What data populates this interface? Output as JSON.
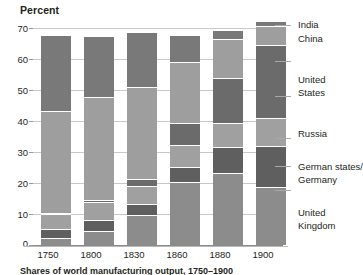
{
  "chart_data": {
    "type": "bar",
    "title": "Percent",
    "subtitle": "",
    "xlabel": "",
    "ylabel": "Percent",
    "ylim": [
      0,
      70
    ],
    "yticks": [
      0,
      10,
      20,
      30,
      40,
      50,
      60,
      70
    ],
    "grid": true,
    "stacked": true,
    "legend_position": "right",
    "categories": [
      "1750",
      "1800",
      "1830",
      "1860",
      "1880",
      "1900"
    ],
    "series": [
      {
        "name": "United Kingdom",
        "color": "#8c8c8c",
        "values": [
          1.9,
          4.3,
          9.5,
          19.9,
          22.9,
          18.5
        ]
      },
      {
        "name": "German states/ Germany",
        "color": "#5f5f5f",
        "values": [
          2.9,
          3.5,
          3.5,
          4.9,
          8.5,
          13.2
        ]
      },
      {
        "name": "Russia",
        "color": "#a0a0a0",
        "values": [
          5.0,
          5.6,
          5.6,
          7.0,
          7.6,
          8.8
        ]
      },
      {
        "name": "United States",
        "color": "#6b6b6b",
        "values": [
          0.1,
          0.8,
          2.4,
          7.2,
          14.7,
          23.6
        ]
      },
      {
        "name": "China",
        "color": "#9e9e9e",
        "values": [
          32.8,
          33.3,
          29.8,
          19.7,
          12.5,
          6.2
        ]
      },
      {
        "name": "India",
        "color": "#797979",
        "values": [
          24.5,
          19.7,
          17.6,
          8.6,
          2.8,
          1.7
        ]
      }
    ],
    "legend_entries": [
      {
        "label_line1": "India",
        "label_line2": ""
      },
      {
        "label_line1": "China",
        "label_line2": ""
      },
      {
        "label_line1": "United",
        "label_line2": "States"
      },
      {
        "label_line1": "Russia",
        "label_line2": ""
      },
      {
        "label_line1": "German states/",
        "label_line2": "Germany"
      },
      {
        "label_line1": "United",
        "label_line2": "Kingdom"
      }
    ]
  },
  "axis": {
    "title": "Percent",
    "yticks": [
      "70",
      "60",
      "50",
      "40",
      "30",
      "20",
      "10",
      "0"
    ]
  },
  "xaxis": {
    "labels": [
      "1750",
      "1800",
      "1830",
      "1860",
      "1880",
      "1900"
    ]
  },
  "legend": {
    "india": "India",
    "china": "China",
    "united": "United",
    "states": "States",
    "russia": "Russia",
    "german_states": "German states/",
    "germany": "Germany",
    "united2": "United",
    "kingdom": "Kingdom"
  },
  "caption": {
    "text": "Shares of world manufacturing output, 1750–1900"
  }
}
